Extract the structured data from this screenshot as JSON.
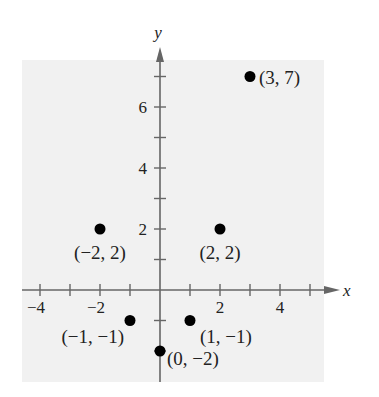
{
  "chart_data": {
    "type": "scatter",
    "title": "",
    "xlabel": "x",
    "ylabel": "y",
    "xlim": [
      -4.6,
      5.5
    ],
    "ylim": [
      -3,
      7.5
    ],
    "grid": false,
    "x_ticks": [
      -4,
      -3,
      -2,
      -1,
      1,
      2,
      3,
      4,
      5
    ],
    "x_tick_labels": [
      {
        "value": -4,
        "label": "−4"
      },
      {
        "value": -2,
        "label": "−2"
      },
      {
        "value": 2,
        "label": "2"
      },
      {
        "value": 4,
        "label": "4"
      }
    ],
    "y_ticks": [
      -2,
      -1,
      1,
      2,
      3,
      4,
      5,
      6,
      7
    ],
    "y_tick_labels": [
      {
        "value": 2,
        "label": "2"
      },
      {
        "value": 4,
        "label": "4"
      },
      {
        "value": 6,
        "label": "6"
      }
    ],
    "points": [
      {
        "x": 3,
        "y": 7,
        "label": "(3, 7)",
        "label_pos": "right"
      },
      {
        "x": -2,
        "y": 2,
        "label": "(−2, 2)",
        "label_pos": "below"
      },
      {
        "x": 2,
        "y": 2,
        "label": "(2, 2)",
        "label_pos": "below"
      },
      {
        "x": -1,
        "y": -1,
        "label": "(−1, −1)",
        "label_pos": "below-left"
      },
      {
        "x": 1,
        "y": -1,
        "label": "(1, −1)",
        "label_pos": "below-right"
      },
      {
        "x": 0,
        "y": -2,
        "label": "(0, −2)",
        "label_pos": "right"
      }
    ]
  },
  "colors": {
    "background": "#ffffff",
    "plot_area": "#f1f1f1",
    "axis": "#666666",
    "point": "#000000",
    "text": "#222222"
  }
}
